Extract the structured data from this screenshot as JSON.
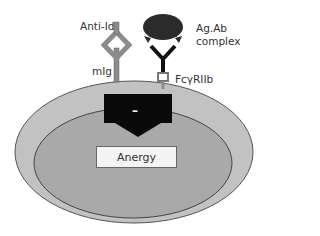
{
  "diagram": {
    "labels": {
      "anti_id": "Anti-Id",
      "mig": "mIg",
      "ag_ab_complex_line1": "Ag.Ab",
      "ag_ab_complex_line2": "complex",
      "fc_receptor": "FcγRIIb",
      "outcome": "Anergy",
      "inhibition_sign": "–"
    },
    "colors": {
      "outer_cell": "#c2c2c2",
      "inner_cell": "#a9a9a9",
      "receptor": "#8c8c8c",
      "complex": "#2b2b2b",
      "signal_box": "#0a0a0a",
      "anergy_box": "#f4f4f4"
    }
  }
}
